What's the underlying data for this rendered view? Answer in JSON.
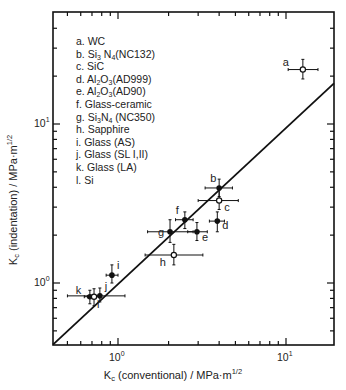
{
  "chart_data": {
    "type": "scatter",
    "title": "",
    "xlabel": "K_c (conventional) / MPa·m^1/2",
    "ylabel": "K_c (indentation) / MPa·m^1/2",
    "xscale": "log",
    "yscale": "log",
    "xlim": [
      0.41,
      19.3
    ],
    "ylim": [
      0.41,
      50
    ],
    "grid": false,
    "legend_position": "upper-left",
    "x_tick_labels": [
      "10^0",
      "10^1"
    ],
    "y_tick_labels": [
      "10^0",
      "10^1"
    ],
    "reference_line": {
      "label": "y = x",
      "x": [
        0.41,
        19.3
      ],
      "y": [
        0.41,
        18
      ]
    },
    "legend": [
      "a. WC",
      "b. Si3N4(NC132)",
      "c. SiC",
      "d. Al2O3(AD999)",
      "e. Al2O3(AD90)",
      "f. Glass-ceramic",
      "g. Si3N4 (NC350)",
      "h. Sapphire",
      "i. Glass (AS)",
      "j. Glass (SL I,II)",
      "k. Glass (LA)",
      "l. Si"
    ],
    "points": [
      {
        "id": "a",
        "material": "WC",
        "x": 12.6,
        "y": 22,
        "xerr": [
          10.3,
          15.5
        ],
        "yerr": [
          19.2,
          25.5
        ],
        "marker": "open"
      },
      {
        "id": "b",
        "material": "Si3N4(NC132)",
        "x": 4.0,
        "y": 3.96,
        "xerr": [
          3.3,
          4.8
        ],
        "yerr": [
          3.5,
          4.5
        ],
        "marker": "filled"
      },
      {
        "id": "c",
        "material": "SiC",
        "x": 4.0,
        "y": 3.3,
        "xerr": [
          3.0,
          5.2
        ],
        "yerr": [
          2.9,
          3.9
        ],
        "marker": "open"
      },
      {
        "id": "d",
        "material": "Al2O3(AD999)",
        "x": 3.9,
        "y": 2.45,
        "xerr": [
          3.5,
          4.3
        ],
        "yerr": [
          2.1,
          2.8
        ],
        "marker": "filled"
      },
      {
        "id": "e",
        "material": "Al2O3(AD90)",
        "x": 2.95,
        "y": 2.1,
        "xerr": [
          2.6,
          3.4
        ],
        "yerr": [
          1.85,
          2.4
        ],
        "marker": "filled"
      },
      {
        "id": "f",
        "material": "Glass-ceramic",
        "x": 2.5,
        "y": 2.5,
        "xerr": [
          2.2,
          2.8
        ],
        "yerr": [
          2.2,
          2.8
        ],
        "marker": "filled"
      },
      {
        "id": "g",
        "material": "Si3N4 (NC350)",
        "x": 2.04,
        "y": 2.1,
        "xerr": [
          1.5,
          2.8
        ],
        "yerr": [
          1.8,
          2.5
        ],
        "marker": "filled"
      },
      {
        "id": "h",
        "material": "Sapphire",
        "x": 2.15,
        "y": 1.5,
        "xerr": [
          1.45,
          3.2
        ],
        "yerr": [
          1.3,
          1.75
        ],
        "marker": "open"
      },
      {
        "id": "i",
        "material": "Glass (AS)",
        "x": 0.92,
        "y": 1.12,
        "xerr": [
          0.85,
          1.0
        ],
        "yerr": [
          1.0,
          1.3
        ],
        "marker": "filled"
      },
      {
        "id": "j",
        "material": "Glass (SL I,II)",
        "x": 0.78,
        "y": 0.83,
        "xerr": [
          0.5,
          1.1
        ],
        "yerr": [
          0.76,
          0.93
        ],
        "marker": "filled"
      },
      {
        "id": "k",
        "material": "Glass (LA)",
        "x": 0.68,
        "y": 0.82,
        "xerr": [
          0.63,
          0.73
        ],
        "yerr": [
          0.74,
          0.9
        ],
        "marker": "filled"
      },
      {
        "id": "l",
        "material": "Si",
        "x": 0.72,
        "y": 0.82,
        "xerr": [
          0.66,
          0.78
        ],
        "yerr": [
          0.72,
          0.92
        ],
        "marker": "open"
      }
    ]
  },
  "legend_items": [
    {
      "pre": "a. WC",
      "parts": []
    },
    {
      "pre": "b. Si",
      "parts": [
        [
          "3",
          " N"
        ],
        [
          "4",
          "(NC132)"
        ]
      ]
    },
    {
      "pre": "c. SiC",
      "parts": []
    },
    {
      "pre": "d. Al",
      "parts": [
        [
          "2",
          "O"
        ],
        [
          "3",
          "(AD999)"
        ]
      ]
    },
    {
      "pre": "e. Al",
      "parts": [
        [
          "2",
          "O"
        ],
        [
          "3",
          "(AD90)"
        ]
      ]
    },
    {
      "pre": "f.  Glass-ceramic",
      "parts": []
    },
    {
      "pre": "g. Si",
      "parts": [
        [
          "3",
          "N"
        ],
        [
          "4",
          " (NC350)"
        ]
      ]
    },
    {
      "pre": "h. Sapphire",
      "parts": []
    },
    {
      "pre": "i.  Glass (AS)",
      "parts": []
    },
    {
      "pre": "j.  Glass (SL I,II)",
      "parts": []
    },
    {
      "pre": "k. Glass (LA)",
      "parts": []
    },
    {
      "pre": "l.  Si",
      "parts": []
    }
  ],
  "axes": {
    "x_title_main": "K",
    "x_title_sub": "c",
    "x_title_rest": " (conventional) / MPa·m",
    "x_title_sup": "1/2",
    "y_title_main": "K",
    "y_title_sub": "c",
    "y_title_rest": " (indentation) / MPa·m",
    "y_title_sup": "1/2",
    "tick_base": "10",
    "tick_exp_0": "0",
    "tick_exp_1": "1"
  },
  "style": {
    "ink": "#111111",
    "background": "#ffffff"
  }
}
